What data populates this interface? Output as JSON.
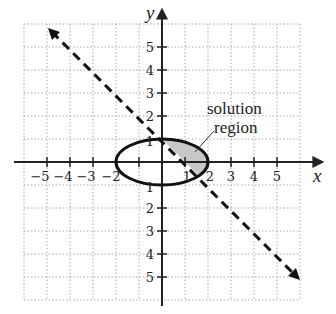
{
  "graph": {
    "x_axis_label": "x",
    "y_axis_label": "y",
    "x_tick_labels": [
      "−5",
      "−4",
      "−3",
      "−2",
      "1",
      "2",
      "3",
      "4",
      "5"
    ],
    "x_tick_values": [
      -5,
      -4,
      -3,
      -2,
      1,
      2,
      3,
      4,
      5
    ],
    "y_tick_labels": [
      "5",
      "4",
      "3",
      "2",
      "1",
      "1",
      "2",
      "3",
      "4",
      "5"
    ],
    "y_tick_values": [
      5,
      4,
      3,
      2,
      1,
      -1,
      -2,
      -3,
      -4,
      -5
    ],
    "grid_range": [
      -6,
      6
    ],
    "annotation_line1": "solution",
    "annotation_line2": "region",
    "ellipse": {
      "cx": 0,
      "cy": 0,
      "rx": 2,
      "ry": 1
    },
    "line": {
      "description": "dashed line through (0,1) and (1,0) approx, slope -1",
      "style": "dashed"
    },
    "shade_color": "#c8c8c8"
  }
}
